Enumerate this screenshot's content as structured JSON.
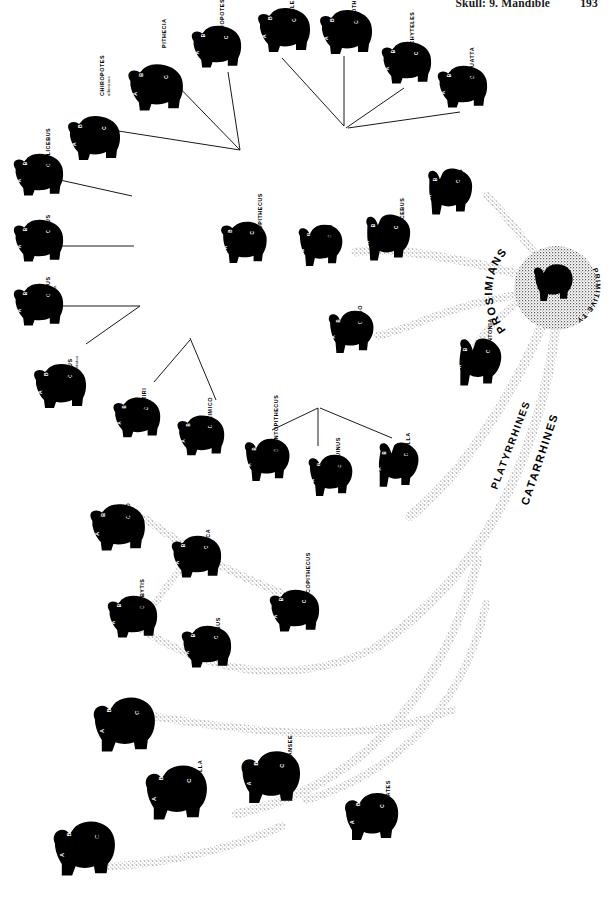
{
  "page": {
    "running_head": "Skull:  9. Mandible",
    "page_number": "193",
    "background_color": "#ffffff",
    "ink_color": "#000000"
  },
  "hub": {
    "center_label": "PRIMITIVE TYPE",
    "fill_pattern": "stipple"
  },
  "group_labels": [
    {
      "id": "prosimians",
      "text": "PROSIMIANS"
    },
    {
      "id": "platyrrhines",
      "text": "PLATYRRHINES"
    },
    {
      "id": "catarrhines",
      "text": "CATARRHINES"
    }
  ],
  "skull_markers": [
    "A",
    "B",
    "C"
  ],
  "taxa": [
    {
      "id": "chiropotes-albinasus",
      "label": "CHIROPOTES",
      "species": "albinasus",
      "group": "platyrrhines",
      "x": 62,
      "y": 112,
      "scale": 1.0,
      "rot": 0,
      "label_x": 104,
      "label_y": 96
    },
    {
      "id": "pithecia",
      "label": "PITHECIA",
      "species": "",
      "group": "platyrrhines",
      "x": 122,
      "y": 60,
      "scale": 1.05,
      "rot": 0,
      "label_x": 166,
      "label_y": 48
    },
    {
      "id": "chiropotes",
      "label": "CHIROPOTES",
      "species": "",
      "group": "platyrrhines",
      "x": 186,
      "y": 22,
      "scale": 0.95,
      "rot": 0,
      "label_x": 224,
      "label_y": 40
    },
    {
      "id": "ateles",
      "label": "ATELES",
      "species": "",
      "group": "platyrrhines",
      "x": 252,
      "y": 4,
      "scale": 1.0,
      "rot": 0,
      "label_x": 294,
      "label_y": 20
    },
    {
      "id": "lagothrix",
      "label": "LAGOTHRIX",
      "species": "",
      "group": "platyrrhines",
      "x": 314,
      "y": 6,
      "scale": 1.0,
      "rot": 0,
      "label_x": 356,
      "label_y": 26
    },
    {
      "id": "brachyteles",
      "label": "BRACHYTELES",
      "species": "",
      "group": "platyrrhines",
      "x": 376,
      "y": 38,
      "scale": 0.95,
      "rot": 0,
      "label_x": 414,
      "label_y": 58
    },
    {
      "id": "alouatta",
      "label": "ALOUATTA",
      "species": "",
      "group": "platyrrhines",
      "x": 432,
      "y": 62,
      "scale": 0.95,
      "rot": 0,
      "label_x": 474,
      "label_y": 80
    },
    {
      "id": "callicebus",
      "label": "CALLICEBUS",
      "species": "",
      "group": "platyrrhines",
      "x": 8,
      "y": 150,
      "scale": 0.95,
      "rot": 0,
      "label_x": 50,
      "label_y": 168
    },
    {
      "id": "aotus",
      "label": "AOTUS",
      "species": "",
      "group": "platyrrhines",
      "x": 8,
      "y": 216,
      "scale": 0.95,
      "rot": 0,
      "label_x": 50,
      "label_y": 236
    },
    {
      "id": "cebus-apella",
      "label": "CEBUS",
      "species": "apella",
      "group": "platyrrhines",
      "x": 8,
      "y": 280,
      "scale": 0.95,
      "rot": 0,
      "label_x": 50,
      "label_y": 298
    },
    {
      "id": "cebus-nigrivittatus",
      "label": "CEBUS",
      "species": "nigrivittatus",
      "group": "platyrrhines",
      "x": 28,
      "y": 360,
      "scale": 1.0,
      "rot": 0,
      "label_x": 72,
      "label_y": 380
    },
    {
      "id": "saimiri",
      "label": "SAIMIRI",
      "species": "",
      "group": "platyrrhines",
      "x": 108,
      "y": 394,
      "scale": 0.9,
      "rot": 0,
      "label_x": 146,
      "label_y": 412
    },
    {
      "id": "callimico",
      "label": "CALLIMICO",
      "species": "",
      "group": "platyrrhines",
      "x": 172,
      "y": 412,
      "scale": 0.9,
      "rot": 0,
      "label_x": 212,
      "label_y": 432
    },
    {
      "id": "leontopithecus",
      "label": "LEONTOPITHECUS",
      "species": "",
      "group": "platyrrhines",
      "x": 238,
      "y": 436,
      "scale": 0.9,
      "rot": 0,
      "label_x": 278,
      "label_y": 452
    },
    {
      "id": "saguinus",
      "label": "SAGUINUS",
      "species": "",
      "group": "platyrrhines",
      "x": 302,
      "y": 452,
      "scale": 0.88,
      "rot": 0,
      "label_x": 340,
      "label_y": 470
    },
    {
      "id": "cebuella",
      "label": "CEBUELLA",
      "species": "",
      "group": "platyrrhines",
      "x": 368,
      "y": 440,
      "scale": 0.9,
      "rot": 0,
      "label_x": 410,
      "label_y": 466
    },
    {
      "id": "propithecus",
      "label": "PROPITHECUS",
      "species": "",
      "group": "prosimians",
      "x": 214,
      "y": 218,
      "scale": 0.92,
      "rot": 0,
      "label_x": 262,
      "label_y": 238
    },
    {
      "id": "lemur",
      "label": "LEMUR",
      "species": "",
      "group": "prosimians",
      "x": 292,
      "y": 222,
      "scale": 0.88,
      "rot": 0,
      "label_x": 332,
      "label_y": 246
    },
    {
      "id": "microcebus",
      "label": "MICROCEBUS",
      "species": "",
      "group": "prosimians",
      "x": 356,
      "y": 212,
      "scale": 0.95,
      "rot": 0,
      "label_x": 404,
      "label_y": 240
    },
    {
      "id": "galago",
      "label": "GALAGO",
      "species": "",
      "group": "prosimians",
      "x": 322,
      "y": 308,
      "scale": 0.9,
      "rot": 0,
      "label_x": 362,
      "label_y": 332
    },
    {
      "id": "tarsius",
      "label": "TARSIUS",
      "species": "",
      "group": "prosimians",
      "x": 418,
      "y": 166,
      "scale": 0.95,
      "rot": 0,
      "label_x": 462,
      "label_y": 196
    },
    {
      "id": "daubentonia",
      "label": "DAUBENTONIA",
      "species": "",
      "group": "prosimians",
      "x": 448,
      "y": 336,
      "scale": 0.95,
      "rot": 0,
      "label_x": 492,
      "label_y": 364
    },
    {
      "id": "papio",
      "label": "PAPIO",
      "species": "",
      "group": "catarrhines",
      "x": 84,
      "y": 500,
      "scale": 1.05,
      "rot": 0,
      "label_x": 130,
      "label_y": 522
    },
    {
      "id": "macaca",
      "label": "MACACA",
      "species": "",
      "group": "catarrhines",
      "x": 166,
      "y": 532,
      "scale": 0.95,
      "rot": 0,
      "label_x": 210,
      "label_y": 556
    },
    {
      "id": "presbytis",
      "label": "PRESBYTIS",
      "species": "",
      "group": "catarrhines",
      "x": 102,
      "y": 592,
      "scale": 0.95,
      "rot": 0,
      "label_x": 144,
      "label_y": 614
    },
    {
      "id": "colobus",
      "label": "COLOBUS",
      "species": "",
      "group": "catarrhines",
      "x": 176,
      "y": 622,
      "scale": 0.95,
      "rot": 0,
      "label_x": 220,
      "label_y": 648
    },
    {
      "id": "cercopithecus",
      "label": "CERCOPITHECUS",
      "species": "",
      "group": "catarrhines",
      "x": 264,
      "y": 586,
      "scale": 0.95,
      "rot": 0,
      "label_x": 310,
      "label_y": 606
    },
    {
      "id": "pongo",
      "label": "PONGO",
      "species": "",
      "group": "catarrhines",
      "x": 88,
      "y": 694,
      "scale": 1.15,
      "rot": 0,
      "label_x": 142,
      "label_y": 722
    },
    {
      "id": "gorilla",
      "label": "GORILLA",
      "species": "",
      "group": "catarrhines",
      "x": 140,
      "y": 762,
      "scale": 1.15,
      "rot": 0,
      "label_x": 202,
      "label_y": 788
    },
    {
      "id": "chimpansee",
      "label": "CHIMPANSEE",
      "species": "",
      "group": "catarrhines",
      "x": 236,
      "y": 748,
      "scale": 1.1,
      "rot": 0,
      "label_x": 292,
      "label_y": 776
    },
    {
      "id": "homo",
      "label": "HOMO",
      "species": "",
      "group": "catarrhines",
      "x": 48,
      "y": 818,
      "scale": 1.15,
      "rot": 0,
      "label_x": 100,
      "label_y": 848
    },
    {
      "id": "hylobates",
      "label": "HYLOBATES",
      "species": "",
      "group": "catarrhines",
      "x": 340,
      "y": 790,
      "scale": 1.0,
      "rot": 0,
      "label_x": 390,
      "label_y": 818
    }
  ]
}
